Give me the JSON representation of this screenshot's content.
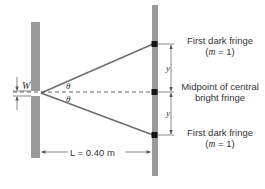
{
  "diagram": {
    "slit_width_label": "W",
    "angle_label_upper": "θ",
    "angle_label_lower": "θ",
    "distance_label": "L = 0.40 m",
    "y_label_upper": "y",
    "y_label_lower": "y",
    "fringes": {
      "top": {
        "line1": "First dark fringe",
        "line2_prefix": "(",
        "line2_var": "m",
        "line2_suffix": " = 1)"
      },
      "middle": {
        "line1": "Midpoint of central",
        "line2": "bright fringe"
      },
      "bottom": {
        "line1": "First dark fringe",
        "line2_prefix": "(",
        "line2_var": "m",
        "line2_suffix": " = 1)"
      }
    },
    "colors": {
      "slit_plate": "#9a9a9a",
      "screen": "#9a9a9a",
      "ray": "#6e6e6e",
      "fringe_marker": "#111111",
      "dashed_axis": "#555555"
    }
  }
}
